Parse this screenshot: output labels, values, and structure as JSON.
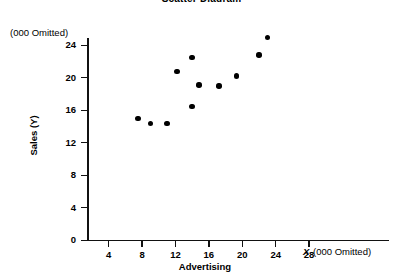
{
  "chart_data": {
    "type": "scatter",
    "title": "Scatter Diagram",
    "xlabel": "Advertising",
    "ylabel": "Sales (Y)",
    "x_unit_note": "(000 Omitted)",
    "y_unit_note": "(000 Omitted)",
    "x_variable_symbol": "X",
    "xlim": [
      0,
      32
    ],
    "ylim": [
      0,
      26
    ],
    "grid": false,
    "legend": null,
    "x_ticks": [
      4,
      8,
      12,
      16,
      20,
      24,
      28
    ],
    "y_ticks": [
      0,
      4,
      8,
      12,
      16,
      20,
      24
    ],
    "x_tick_labels": [
      "4",
      "8",
      "12",
      "16",
      "20",
      "24",
      "28"
    ],
    "y_tick_labels": [
      "0",
      "4",
      "8",
      "12",
      "16",
      "20",
      "24"
    ],
    "points": [
      {
        "x": 7.5,
        "y": 15.0
      },
      {
        "x": 9.0,
        "y": 14.4
      },
      {
        "x": 11.0,
        "y": 14.4
      },
      {
        "x": 12.2,
        "y": 20.8
      },
      {
        "x": 14.0,
        "y": 22.5
      },
      {
        "x": 14.0,
        "y": 16.5
      },
      {
        "x": 14.8,
        "y": 19.1
      },
      {
        "x": 17.2,
        "y": 19.0
      },
      {
        "x": 19.3,
        "y": 20.2
      },
      {
        "x": 22.0,
        "y": 22.8
      },
      {
        "x": 23.0,
        "y": 25.0
      }
    ]
  }
}
